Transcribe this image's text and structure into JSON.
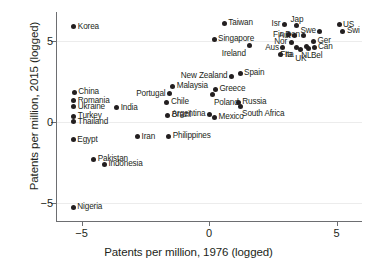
{
  "chart_data": {
    "type": "scatter",
    "title": "",
    "xlabel": "Patents per million, 1976 (logged)",
    "ylabel": "Patents per million, 2015 (logged)",
    "xlim": [
      -6.0,
      6.0
    ],
    "ylim": [
      -6.2,
      6.8
    ],
    "xticks": [
      -5,
      0,
      5
    ],
    "xtick_labels": [
      "−5",
      "0",
      "5"
    ],
    "yticks": [
      5,
      0,
      -5
    ],
    "ytick_labels": [
      "5",
      "0",
      "−5"
    ],
    "grid": "horizontal-faint",
    "legend": "none",
    "marker_color": "#231f20",
    "axis_color": "#6d6e71",
    "points": [
      {
        "label": "Korea",
        "x": -5.3,
        "y": 5.9,
        "pos": "lab-r"
      },
      {
        "label": "Taiwan",
        "x": 0.6,
        "y": 6.1,
        "pos": "lab-r"
      },
      {
        "label": "Singapore",
        "x": 0.2,
        "y": 5.1,
        "pos": "lab-r"
      },
      {
        "label": "Ireland",
        "x": 1.6,
        "y": 4.7,
        "pos": "lab-bl"
      },
      {
        "label": "Isr",
        "x": 2.95,
        "y": 6.05,
        "pos": "lab-l"
      },
      {
        "label": "Jap",
        "x": 3.45,
        "y": 5.95,
        "pos": "lab-t"
      },
      {
        "label": "Swe",
        "x": 4.35,
        "y": 5.62,
        "pos": "lab-l"
      },
      {
        "label": "US",
        "x": 5.1,
        "y": 6.0,
        "pos": "lab-r"
      },
      {
        "label": "Swi",
        "x": 5.25,
        "y": 5.62,
        "pos": "lab-r"
      },
      {
        "label": "Fin",
        "x": 3.1,
        "y": 5.4,
        "pos": "lab-l"
      },
      {
        "label": "Aut",
        "x": 3.35,
        "y": 5.32,
        "pos": "lab-l"
      },
      {
        "label": "Den",
        "x": 3.72,
        "y": 5.35,
        "pos": "lab-l"
      },
      {
        "label": "Ger",
        "x": 4.1,
        "y": 5.0,
        "pos": "lab-r"
      },
      {
        "label": "Nor",
        "x": 3.22,
        "y": 4.92,
        "pos": "lab-l"
      },
      {
        "label": "Can",
        "x": 4.12,
        "y": 4.62,
        "pos": "lab-r"
      },
      {
        "label": "NL",
        "x": 3.82,
        "y": 4.68,
        "pos": "lab-b"
      },
      {
        "label": "Bel",
        "x": 3.92,
        "y": 4.55,
        "pos": "lab-br"
      },
      {
        "label": "Fra",
        "x": 3.42,
        "y": 4.62,
        "pos": "lab-bl"
      },
      {
        "label": "UK",
        "x": 3.6,
        "y": 4.5,
        "pos": "lab-b"
      },
      {
        "label": "Aus",
        "x": 2.9,
        "y": 4.58,
        "pos": "lab-l"
      },
      {
        "label": "Ita",
        "x": 2.82,
        "y": 4.15,
        "pos": "lab-r"
      },
      {
        "label": "Spain",
        "x": 1.22,
        "y": 3.0,
        "pos": "lab-r"
      },
      {
        "label": "New Zealand",
        "x": 0.88,
        "y": 2.82,
        "pos": "lab-l"
      },
      {
        "label": "Malaysia",
        "x": -1.42,
        "y": 2.2,
        "pos": "lab-r"
      },
      {
        "label": "Greece",
        "x": 0.25,
        "y": 2.02,
        "pos": "lab-r"
      },
      {
        "label": "Portugal",
        "x": -1.55,
        "y": 1.75,
        "pos": "lab-l"
      },
      {
        "label": "Poland",
        "x": 0.12,
        "y": 1.68,
        "pos": "lab-br"
      },
      {
        "label": "China",
        "x": -5.28,
        "y": 1.82,
        "pos": "lab-r"
      },
      {
        "label": "Romania",
        "x": -5.3,
        "y": 1.32,
        "pos": "lab-r"
      },
      {
        "label": "Ukraine",
        "x": -5.3,
        "y": 0.92,
        "pos": "lab-r"
      },
      {
        "label": "Chile",
        "x": -1.65,
        "y": 1.22,
        "pos": "lab-r"
      },
      {
        "label": "India",
        "x": -3.62,
        "y": 0.88,
        "pos": "lab-r"
      },
      {
        "label": "Russia",
        "x": 1.15,
        "y": 1.2,
        "pos": "lab-r"
      },
      {
        "label": "South Africa",
        "x": 1.22,
        "y": 0.98,
        "pos": "lab-br"
      },
      {
        "label": "Turkey",
        "x": -5.3,
        "y": 0.35,
        "pos": "lab-r"
      },
      {
        "label": "Thailand",
        "x": -5.3,
        "y": 0.02,
        "pos": "lab-r"
      },
      {
        "label": "Argentina",
        "x": 0.02,
        "y": 0.48,
        "pos": "lab-l"
      },
      {
        "label": "Brazil",
        "x": -1.62,
        "y": 0.42,
        "pos": "lab-r"
      },
      {
        "label": "Mexico",
        "x": 0.22,
        "y": 0.3,
        "pos": "lab-r"
      },
      {
        "label": "Egypt",
        "x": -5.32,
        "y": -1.1,
        "pos": "lab-r"
      },
      {
        "label": "Iran",
        "x": -2.8,
        "y": -0.92,
        "pos": "lab-r"
      },
      {
        "label": "Philippines",
        "x": -1.58,
        "y": -0.88,
        "pos": "lab-r"
      },
      {
        "label": "Pakistan",
        "x": -4.52,
        "y": -2.32,
        "pos": "lab-r"
      },
      {
        "label": "Indonesia",
        "x": -4.1,
        "y": -2.62,
        "pos": "lab-r"
      },
      {
        "label": "Nigeria",
        "x": -5.32,
        "y": -5.3,
        "pos": "lab-r"
      }
    ]
  }
}
